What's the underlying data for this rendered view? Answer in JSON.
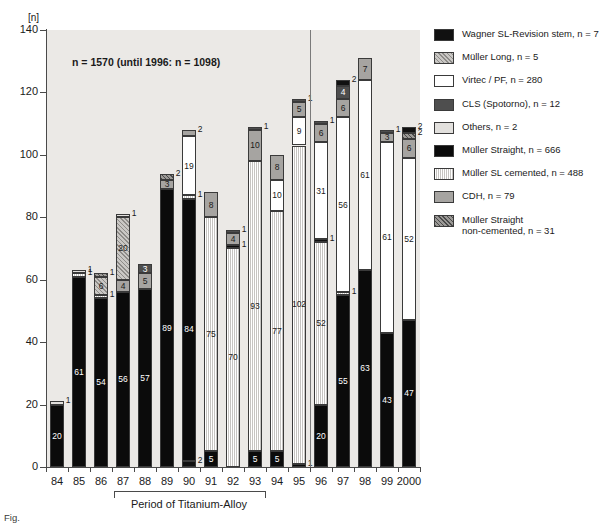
{
  "axis": {
    "unit_label": "[n]",
    "y_ticks": [
      0,
      20,
      40,
      60,
      80,
      100,
      120,
      140
    ],
    "y_min": 0,
    "y_max": 140,
    "x_categories": [
      "84",
      "85",
      "86",
      "87",
      "88",
      "89",
      "90",
      "91",
      "92",
      "93",
      "94",
      "95",
      "96",
      "97",
      "98",
      "99",
      "2000"
    ]
  },
  "annotation": {
    "n_note": "n = 1570 (until 1996: n = 1098)",
    "bracket_label": "Period of Titanium-Alloy",
    "bracket_from": "87",
    "bracket_to": "93",
    "caption": "Fig."
  },
  "legend": {
    "items": [
      {
        "key": "wagner",
        "label": "Wagner SL-Revision stem, n = 7",
        "color": "#111111"
      },
      {
        "key": "mlong",
        "label": "Müller Long, n = 5",
        "color": "#b9b7b4"
      },
      {
        "key": "virtec",
        "label": "Virtec / PF, n = 280",
        "color": "#ffffff"
      },
      {
        "key": "cls",
        "label": "CLS (Spotorno), n = 12",
        "color": "#4e4e4e"
      },
      {
        "key": "others",
        "label": "Others, n = 2",
        "color": "#e2e0dd"
      },
      {
        "key": "mstraight",
        "label": "Müller Straight, n = 666",
        "color": "#0b0b0b"
      },
      {
        "key": "mslcem",
        "label": "Müller SL cemented, n = 488",
        "color": "#dddbd8"
      },
      {
        "key": "cdh",
        "label": "CDH, n = 79",
        "color": "#a6a4a1"
      },
      {
        "key": "msnc",
        "label": "Müller Straight\nnon-cemented, n = 31",
        "color": "#7c7a77"
      }
    ]
  },
  "chart_data": {
    "type": "bar",
    "stacked": true,
    "title": "",
    "xlabel": "",
    "ylabel": "[n]",
    "ylim": [
      0,
      140
    ],
    "grid": false,
    "legend_position": "right",
    "categories": [
      "84",
      "85",
      "86",
      "87",
      "88",
      "89",
      "90",
      "91",
      "92",
      "93",
      "94",
      "95",
      "96",
      "97",
      "98",
      "99",
      "2000"
    ],
    "series_keys": [
      "mstraight",
      "wagner",
      "mlong",
      "virtec",
      "cls",
      "others",
      "mslcem",
      "cdh",
      "msnc"
    ],
    "totals": [
      21,
      63,
      62,
      81,
      65,
      94,
      107,
      83,
      80,
      110,
      95,
      117,
      110,
      119,
      131,
      107,
      107
    ],
    "bars": [
      {
        "x": "84",
        "segments": [
          {
            "key": "mstraight",
            "value": 20,
            "label": "20",
            "label_inside": true
          },
          {
            "key": "others",
            "value": 1,
            "label": "1",
            "label_inside": false
          }
        ]
      },
      {
        "x": "85",
        "segments": [
          {
            "key": "mstraight",
            "value": 61,
            "label": "61",
            "label_inside": true
          },
          {
            "key": "mslcem",
            "value": 1,
            "label": "1",
            "label_inside": false
          },
          {
            "key": "others",
            "value": 1,
            "label": "1",
            "label_inside": false
          }
        ]
      },
      {
        "x": "86",
        "segments": [
          {
            "key": "mstraight",
            "value": 54,
            "label": "54",
            "label_inside": true
          },
          {
            "key": "mslcem",
            "value": 1,
            "label": "1",
            "label_inside": false
          },
          {
            "key": "mlong",
            "value": 6,
            "label": "6",
            "label_inside": true
          },
          {
            "key": "msnc",
            "value": 1,
            "label": "1",
            "label_inside": false
          }
        ]
      },
      {
        "x": "87",
        "segments": [
          {
            "key": "mstraight",
            "value": 56,
            "label": "56",
            "label_inside": true
          },
          {
            "key": "cdh",
            "value": 4,
            "label": "4",
            "label_inside": true
          },
          {
            "key": "mlong",
            "value": 20,
            "label": "20",
            "label_inside": true
          },
          {
            "key": "others",
            "value": 1,
            "label": "1",
            "label_inside": false
          }
        ]
      },
      {
        "x": "88",
        "segments": [
          {
            "key": "mstraight",
            "value": 57,
            "label": "57",
            "label_inside": true
          },
          {
            "key": "cdh",
            "value": 5,
            "label": "5",
            "label_inside": true
          },
          {
            "key": "cls",
            "value": 3,
            "label": "3",
            "label_inside": true
          }
        ]
      },
      {
        "x": "89",
        "segments": [
          {
            "key": "mstraight",
            "value": 89,
            "label": "89",
            "label_inside": true
          },
          {
            "key": "cdh",
            "value": 3,
            "label": "3",
            "label_inside": true
          },
          {
            "key": "msnc",
            "value": 2,
            "label": "2",
            "label_inside": false
          }
        ]
      },
      {
        "x": "90",
        "segments": [
          {
            "key": "wagner",
            "value": 2,
            "label": "2",
            "label_inside": false
          },
          {
            "key": "mstraight",
            "value": 84,
            "label": "84",
            "label_inside": true
          },
          {
            "key": "mslcem",
            "value": 1,
            "label": "1",
            "label_inside": false
          },
          {
            "key": "virtec",
            "value": 19,
            "label": "19",
            "label_inside": true
          },
          {
            "key": "cdh",
            "value": 2,
            "label": "2",
            "label_inside": false
          }
        ]
      },
      {
        "x": "91",
        "segments": [
          {
            "key": "mstraight",
            "value": 5,
            "label": "5",
            "label_inside": true
          },
          {
            "key": "mslcem",
            "value": 75,
            "label": "75",
            "label_inside": true
          },
          {
            "key": "cdh",
            "value": 8,
            "label": "8",
            "label_inside": true
          }
        ]
      },
      {
        "x": "92",
        "segments": [
          {
            "key": "mslcem",
            "value": 70,
            "label": "70",
            "label_inside": true
          },
          {
            "key": "mstraight",
            "value": 1,
            "label": "1",
            "label_inside": false
          },
          {
            "key": "cdh",
            "value": 4,
            "label": "4",
            "label_inside": true
          },
          {
            "key": "cls",
            "value": 1,
            "label": "1",
            "label_inside": false
          }
        ]
      },
      {
        "x": "93",
        "segments": [
          {
            "key": "mstraight",
            "value": 5,
            "label": "5",
            "label_inside": true
          },
          {
            "key": "mslcem",
            "value": 93,
            "label": "93",
            "label_inside": true
          },
          {
            "key": "cdh",
            "value": 10,
            "label": "10",
            "label_inside": true
          },
          {
            "key": "cls",
            "value": 1,
            "label": "1",
            "label_inside": false
          }
        ]
      },
      {
        "x": "94",
        "segments": [
          {
            "key": "mstraight",
            "value": 5,
            "label": "5",
            "label_inside": true
          },
          {
            "key": "mslcem",
            "value": 77,
            "label": "77",
            "label_inside": true
          },
          {
            "key": "virtec",
            "value": 10,
            "label": "10",
            "label_inside": true
          },
          {
            "key": "cdh",
            "value": 8,
            "label": "8",
            "label_inside": true
          }
        ]
      },
      {
        "x": "95",
        "segments": [
          {
            "key": "mstraight",
            "value": 1,
            "label": "1",
            "label_inside": false
          },
          {
            "key": "mslcem",
            "value": 102,
            "label": "102",
            "label_inside": true
          },
          {
            "key": "virtec",
            "value": 9,
            "label": "9",
            "label_inside": true
          },
          {
            "key": "cdh",
            "value": 5,
            "label": "5",
            "label_inside": true
          },
          {
            "key": "cls",
            "value": 1,
            "label": "1",
            "label_inside": false
          }
        ]
      },
      {
        "x": "96",
        "segments": [
          {
            "key": "mstraight",
            "value": 20,
            "label": "20",
            "label_inside": true
          },
          {
            "key": "mslcem",
            "value": 52,
            "label": "52",
            "label_inside": true
          },
          {
            "key": "wagner",
            "value": 1,
            "label": "1",
            "label_inside": false
          },
          {
            "key": "virtec",
            "value": 31,
            "label": "31",
            "label_inside": true
          },
          {
            "key": "cdh",
            "value": 6,
            "label": "6",
            "label_inside": true
          },
          {
            "key": "cls",
            "value": 1,
            "label": "1",
            "label_inside": false
          }
        ]
      },
      {
        "x": "97",
        "segments": [
          {
            "key": "mstraight",
            "value": 55,
            "label": "55",
            "label_inside": true
          },
          {
            "key": "mslcem",
            "value": 1,
            "label": "1",
            "label_inside": false
          },
          {
            "key": "virtec",
            "value": 56,
            "label": "56",
            "label_inside": true
          },
          {
            "key": "cdh",
            "value": 6,
            "label": "6",
            "label_inside": true
          },
          {
            "key": "cls",
            "value": 4,
            "label": "4",
            "label_inside": true
          },
          {
            "key": "wagner",
            "value": 2,
            "label": "2",
            "label_inside": false
          }
        ]
      },
      {
        "x": "98",
        "segments": [
          {
            "key": "mstraight",
            "value": 63,
            "label": "63",
            "label_inside": true
          },
          {
            "key": "virtec",
            "value": 61,
            "label": "61",
            "label_inside": true
          },
          {
            "key": "cdh",
            "value": 7,
            "label": "7",
            "label_inside": true
          }
        ]
      },
      {
        "x": "99",
        "segments": [
          {
            "key": "mstraight",
            "value": 43,
            "label": "43",
            "label_inside": true
          },
          {
            "key": "virtec",
            "value": 61,
            "label": "61",
            "label_inside": true
          },
          {
            "key": "cdh",
            "value": 3,
            "label": "3",
            "label_inside": true
          },
          {
            "key": "cls",
            "value": 1,
            "label": "1",
            "label_inside": false
          }
        ]
      },
      {
        "x": "2000",
        "segments": [
          {
            "key": "mstraight",
            "value": 47,
            "label": "47",
            "label_inside": true
          },
          {
            "key": "virtec",
            "value": 52,
            "label": "52",
            "label_inside": true
          },
          {
            "key": "cdh",
            "value": 6,
            "label": "6",
            "label_inside": true
          },
          {
            "key": "msnc",
            "value": 2,
            "label": "2",
            "label_inside": false
          },
          {
            "key": "wagner",
            "value": 2,
            "label": "2",
            "label_inside": false
          }
        ]
      }
    ]
  }
}
